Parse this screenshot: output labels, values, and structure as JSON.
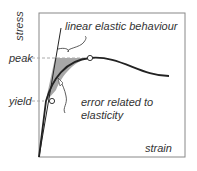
{
  "diagram": {
    "y_axis_label": "stress",
    "x_axis_label": "strain",
    "y_markers": {
      "peak": "peak",
      "yield": "yield"
    },
    "annotations": {
      "linear": "linear elastic behaviour",
      "error_line1": "error related to",
      "error_line2": "elasticity"
    },
    "colors": {
      "line": "#222222",
      "fill": "#a8a8a8",
      "frame": "#888888",
      "dash": "#aaaaaa"
    }
  }
}
